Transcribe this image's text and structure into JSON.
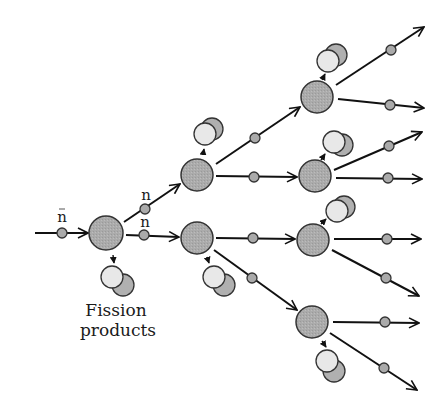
{
  "diagram": {
    "colors": {
      "line": "#111111",
      "nucleus_fill": "#a9a9a9",
      "neutron_fill": "#a9a9a9",
      "product_light": "#e6e6e6",
      "product_dark": "#b3b3b3",
      "outline": "#333333"
    },
    "labels": {
      "neutron_incoming": "n",
      "neutron_upper": "n",
      "neutron_lower": "n",
      "fission_products_line1": "Fission",
      "fission_products_line2": "products"
    },
    "nuclei": [
      {
        "id": "gen1",
        "x": 106,
        "y": 233,
        "r": 17
      },
      {
        "id": "gen2-upper",
        "x": 197,
        "y": 175,
        "r": 16
      },
      {
        "id": "gen2-lower",
        "x": 197,
        "y": 238,
        "r": 16
      },
      {
        "id": "gen3-a",
        "x": 317,
        "y": 97,
        "r": 16
      },
      {
        "id": "gen3-b",
        "x": 315,
        "y": 176,
        "r": 16
      },
      {
        "id": "gen3-c",
        "x": 313,
        "y": 240,
        "r": 16
      },
      {
        "id": "gen3-d",
        "x": 312,
        "y": 322,
        "r": 16
      }
    ],
    "generations": 3,
    "final_neutrons": 8
  }
}
